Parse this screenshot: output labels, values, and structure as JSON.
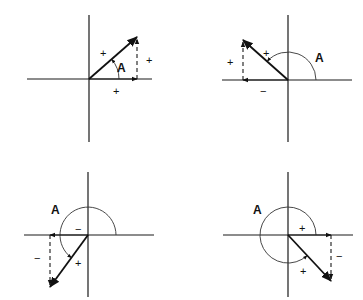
{
  "figure": {
    "width": 363,
    "height": 300,
    "line_color": "#111111"
  },
  "quadrants": [
    {
      "id": "quadrant-1",
      "origin": [
        89,
        79
      ],
      "h_axis": [
        27,
        152
      ],
      "v_axis": [
        15,
        142
      ],
      "vector_tip": [
        137,
        37
      ],
      "h_component_tip": [
        137,
        79
      ],
      "angle_arc": {
        "radius": 30,
        "start_deg": 0,
        "end_deg": 41,
        "arrow_at_end": true
      },
      "labels": {
        "vector_sign": "+",
        "angle": "A",
        "vertical_sign": "+",
        "horizontal_sign": "+"
      },
      "label_pos": {
        "vector_sign": [
          100,
          57
        ],
        "angle": [
          117,
          72
        ],
        "vertical_sign": [
          146,
          64
        ],
        "horizontal_sign": [
          113,
          95
        ]
      }
    },
    {
      "id": "quadrant-2",
      "origin": [
        288,
        80
      ],
      "h_axis": [
        222,
        352
      ],
      "v_axis": [
        15,
        142
      ],
      "vector_tip": [
        243,
        40
      ],
      "h_component_tip": [
        243,
        80
      ],
      "angle_arc": {
        "radius": 28,
        "start_deg": 0,
        "end_deg": 138,
        "arrow_at_end": true
      },
      "labels": {
        "vector_sign": "+",
        "angle": "A",
        "vertical_sign": "+",
        "horizontal_sign": "−"
      },
      "label_pos": {
        "vector_sign": [
          263,
          57
        ],
        "angle": [
          315,
          62
        ],
        "vertical_sign": [
          227,
          66
        ],
        "horizontal_sign": [
          260,
          95
        ]
      }
    },
    {
      "id": "quadrant-3",
      "origin": [
        88,
        235
      ],
      "h_axis": [
        24,
        154
      ],
      "v_axis": [
        172,
        297
      ],
      "vector_tip": [
        50,
        287
      ],
      "h_component_tip": [
        50,
        235
      ],
      "angle_arc": {
        "radius": 28,
        "start_deg": 0,
        "end_deg": 234,
        "arrow_at_end": true
      },
      "labels": {
        "vector_sign": "+",
        "angle": "A",
        "vertical_sign": "−",
        "horizontal_sign": "−"
      },
      "label_pos": {
        "vector_sign": [
          75,
          267
        ],
        "angle": [
          51,
          214
        ],
        "vertical_sign": [
          34,
          262
        ],
        "horizontal_sign": [
          75,
          233
        ]
      }
    },
    {
      "id": "quadrant-4",
      "origin": [
        288,
        235
      ],
      "h_axis": [
        223,
        353
      ],
      "v_axis": [
        172,
        297
      ],
      "vector_tip": [
        331,
        281
      ],
      "h_component_tip": [
        331,
        235
      ],
      "angle_arc": {
        "radius": 28,
        "start_deg": 0,
        "end_deg": 313,
        "arrow_at_end": true
      },
      "labels": {
        "vector_sign": "+",
        "angle": "A",
        "vertical_sign": "−",
        "horizontal_sign": "+"
      },
      "label_pos": {
        "vector_sign": [
          300,
          275
        ],
        "angle": [
          253,
          214
        ],
        "vertical_sign": [
          336,
          260
        ],
        "horizontal_sign": [
          299,
          232
        ]
      }
    }
  ]
}
